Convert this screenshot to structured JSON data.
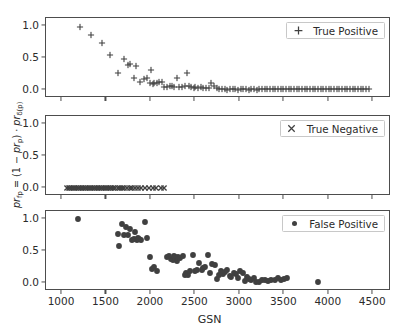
{
  "chart_data": [
    {
      "type": "scatter",
      "panel": "top",
      "title": "",
      "xlabel": "GSN",
      "ylabel": "pr_fp = (1 - pr_p) · pr_δ(p)",
      "legend": "True Positive",
      "marker": "plus",
      "color": "#404040",
      "xlim": [
        820,
        4700
      ],
      "ylim": [
        -0.12,
        1.12
      ],
      "xticks": [
        1000,
        1500,
        2000,
        2500,
        3000,
        3500,
        4000,
        4500
      ],
      "yticks": [
        0.0,
        0.5,
        1.0
      ],
      "grid": false,
      "legend_position": "upper right",
      "x": [
        1205,
        1330,
        1455,
        1545,
        1635,
        1700,
        1740,
        1760,
        1805,
        1830,
        1880,
        1925,
        1960,
        1990,
        2005,
        2020,
        2040,
        2065,
        2090,
        2120,
        2150,
        2185,
        2215,
        2240,
        2265,
        2290,
        2320,
        2350,
        2380,
        2405,
        2430,
        2455,
        2480,
        2500,
        2530,
        2560,
        2590,
        2620,
        2650,
        2680,
        2710,
        2740,
        2770,
        2800,
        2830,
        2860,
        2890,
        2920,
        2950,
        2980,
        3010,
        3040,
        3070,
        3100,
        3130,
        3160,
        3190,
        3220,
        3250,
        3280,
        3310,
        3340,
        3370,
        3400,
        3430,
        3460,
        3490,
        3520,
        3550,
        3580,
        3610,
        3640,
        3670,
        3700,
        3730,
        3760,
        3790,
        3820,
        3850,
        3880,
        3910,
        3940,
        3970,
        4000,
        4030,
        4060,
        4090,
        4120,
        4150,
        4180,
        4210,
        4240,
        4270,
        4300,
        4330,
        4360,
        4390,
        4420,
        4450
      ],
      "y": [
        0.98,
        0.855,
        0.725,
        0.545,
        0.275,
        0.48,
        0.385,
        0.405,
        0.195,
        0.38,
        0.125,
        0.17,
        0.185,
        0.105,
        0.315,
        0.1,
        0.105,
        0.12,
        0.125,
        0.125,
        0.055,
        0.055,
        0.065,
        0.06,
        0.055,
        0.195,
        0.055,
        0.055,
        0.06,
        0.275,
        0.06,
        0.045,
        0.04,
        0.05,
        0.035,
        0.045,
        0.04,
        0.035,
        0.03,
        0.105,
        0.065,
        0.03,
        0.025,
        0.02,
        0.015,
        0.01,
        0.02,
        0.02,
        0.015,
        0.01,
        0.015,
        0.02,
        0.015,
        0.01,
        0.02,
        0.015,
        0.01,
        0.02,
        0.02,
        0.015,
        0.02,
        0.025,
        0.015,
        0.02,
        0.02,
        0.02,
        0.015,
        0.02,
        0.02,
        0.02,
        0.02,
        0.02,
        0.02,
        0.02,
        0.02,
        0.02,
        0.02,
        0.02,
        0.02,
        0.02,
        0.02,
        0.02,
        0.02,
        0.02,
        0.02,
        0.02,
        0.02,
        0.02,
        0.02,
        0.02,
        0.02,
        0.02,
        0.02,
        0.02,
        0.02,
        0.02,
        0.02,
        0.02,
        0.02
      ]
    },
    {
      "type": "scatter",
      "panel": "middle",
      "title": "",
      "xlabel": "GSN",
      "ylabel": "pr_fp = (1 - pr_p) · pr_δ(p)",
      "legend": "True Negative",
      "marker": "cross",
      "color": "#404040",
      "xlim": [
        820,
        4700
      ],
      "ylim": [
        -0.12,
        1.12
      ],
      "xticks": [
        1000,
        1500,
        2000,
        2500,
        3000,
        3500,
        4000,
        4500
      ],
      "yticks": [
        0.0,
        0.5,
        1.0
      ],
      "grid": false,
      "legend_position": "upper right",
      "x": [
        1055,
        1075,
        1095,
        1115,
        1135,
        1155,
        1175,
        1195,
        1215,
        1235,
        1255,
        1275,
        1295,
        1315,
        1335,
        1355,
        1375,
        1395,
        1415,
        1435,
        1455,
        1475,
        1495,
        1515,
        1535,
        1555,
        1575,
        1600,
        1625,
        1650,
        1675,
        1700,
        1730,
        1760,
        1790,
        1820,
        1855,
        1890,
        1930,
        1975,
        2020,
        2060,
        2110,
        2150
      ],
      "y": [
        0,
        0,
        0,
        0,
        0,
        0,
        0,
        0,
        0,
        0,
        0,
        0,
        0,
        0,
        0,
        0,
        0,
        0,
        0,
        0,
        0,
        0,
        0,
        0,
        0,
        0,
        0,
        0,
        0,
        0,
        0,
        0,
        0,
        0,
        0,
        0,
        0,
        0,
        0,
        0,
        0,
        0,
        0,
        0
      ]
    },
    {
      "type": "scatter",
      "panel": "bottom",
      "title": "",
      "xlabel": "GSN",
      "ylabel": "pr_fp = (1 - pr_p) · pr_δ(p)",
      "legend": "False Positive",
      "marker": "circle",
      "color": "#404040",
      "xlim": [
        820,
        4700
      ],
      "ylim": [
        -0.12,
        1.12
      ],
      "xticks": [
        1000,
        1500,
        2000,
        2500,
        3000,
        3500,
        4000,
        4500
      ],
      "yticks": [
        0.0,
        0.5,
        1.0
      ],
      "grid": false,
      "legend_position": "upper right",
      "x": [
        1180,
        1625,
        1645,
        1670,
        1700,
        1715,
        1745,
        1760,
        1790,
        1805,
        1820,
        1840,
        1855,
        1870,
        1890,
        1935,
        1960,
        1985,
        2010,
        2040,
        2065,
        2185,
        2205,
        2225,
        2245,
        2260,
        2275,
        2290,
        2305,
        2330,
        2360,
        2385,
        2400,
        2420,
        2445,
        2470,
        2495,
        2520,
        2545,
        2570,
        2590,
        2610,
        2640,
        2660,
        2690,
        2715,
        2740,
        2760,
        2785,
        2810,
        2835,
        2860,
        2885,
        2905,
        2930,
        2955,
        2980,
        3005,
        3030,
        3055,
        3080,
        3105,
        3130,
        3155,
        3185,
        3215,
        3250,
        3285,
        3320,
        3355,
        3390,
        3425,
        3460,
        3495,
        3530,
        3880
      ],
      "y": [
        0.99,
        0.765,
        0.575,
        0.925,
        0.755,
        0.865,
        0.755,
        0.835,
        0.67,
        0.69,
        0.8,
        0.665,
        0.7,
        0.685,
        0.675,
        0.945,
        0.695,
        0.4,
        0.225,
        0.245,
        0.195,
        0.405,
        0.43,
        0.38,
        0.355,
        0.415,
        0.4,
        0.345,
        0.4,
        0.395,
        0.415,
        0.135,
        0.155,
        0.125,
        0.185,
        0.44,
        0.195,
        0.21,
        0.315,
        0.2,
        0.235,
        0.255,
        0.44,
        0.155,
        0.3,
        0.285,
        0.065,
        0.125,
        0.195,
        0.145,
        0.17,
        0.21,
        0.115,
        0.095,
        0.155,
        0.15,
        0.085,
        0.185,
        0.155,
        0.03,
        0.095,
        0.06,
        0.055,
        0.085,
        0.02,
        0.015,
        0.045,
        0.055,
        0.04,
        0.045,
        0.05,
        0.075,
        0.055,
        0.06,
        0.08,
        0.02
      ]
    }
  ],
  "axes": {
    "xlabel": "GSN",
    "xticks": [
      "1000",
      "1500",
      "2000",
      "2500",
      "3000",
      "3500",
      "4000",
      "4500"
    ],
    "yticks": [
      "0.0",
      "0.5",
      "1.0"
    ],
    "ylabel_parts": {
      "pr": "pr",
      "fp": "fp",
      "eq": " = (1 − ",
      "pr2": "pr",
      "p": "p",
      "mid": ") · ",
      "pr3": "pr",
      "delta_p": "δ(p)"
    }
  },
  "legends": {
    "top": "True Positive",
    "middle": "True Negative",
    "bottom": "False Positive"
  },
  "style": {
    "marker_color": "#404040",
    "axis_color": "#4d4d4d",
    "text_color": "#2b2b2b",
    "legend_border": "#c8c8c8",
    "background": "#ffffff"
  }
}
